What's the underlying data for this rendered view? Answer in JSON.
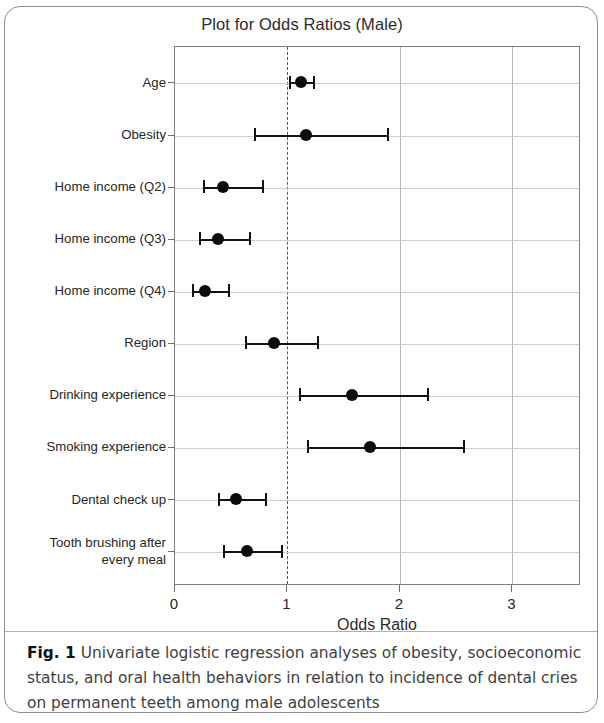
{
  "figure": {
    "caption_label": "Fig. 1",
    "caption_text": "Univariate logistic regression analyses of obesity, socioeconomic status, and oral health behaviors in relation to incidence of dental cries on permanent teeth among male adolescents"
  },
  "chart_data": {
    "type": "forest",
    "title": "Plot for Odds Ratios (Male)",
    "xlabel": "Odds Ratio",
    "ylabel": "",
    "xlim": [
      0,
      3.61
    ],
    "xticks": [
      0,
      1,
      2,
      3
    ],
    "xtick_labels": [
      "0",
      "1",
      "2",
      "3"
    ],
    "reference_line": 1,
    "grid": "both",
    "legend": "none",
    "categories": [
      "Age",
      "Obesity",
      "Home income (Q2)",
      "Home income (Q3)",
      "Home income (Q4)",
      "Region",
      "Drinking experience",
      "Smoking experience",
      "Dental check up",
      "Tooth brushing after\nevery meal"
    ],
    "series": [
      {
        "name": "Odds ratio (95% CI)",
        "points": [
          {
            "label": "Age",
            "or": 1.13,
            "ci_low": 1.02,
            "ci_high": 1.24
          },
          {
            "label": "Obesity",
            "or": 1.17,
            "ci_low": 0.71,
            "ci_high": 1.89
          },
          {
            "label": "Home income (Q2)",
            "or": 0.44,
            "ci_low": 0.26,
            "ci_high": 0.78
          },
          {
            "label": "Home income (Q3)",
            "or": 0.39,
            "ci_low": 0.22,
            "ci_high": 0.67
          },
          {
            "label": "Home income (Q4)",
            "or": 0.28,
            "ci_low": 0.16,
            "ci_high": 0.48
          },
          {
            "label": "Region",
            "or": 0.89,
            "ci_low": 0.63,
            "ci_high": 1.27
          },
          {
            "label": "Drinking experience",
            "or": 1.58,
            "ci_low": 1.11,
            "ci_high": 2.25
          },
          {
            "label": "Smoking experience",
            "or": 1.74,
            "ci_low": 1.18,
            "ci_high": 2.57
          },
          {
            "label": "Dental check up",
            "or": 0.55,
            "ci_low": 0.39,
            "ci_high": 0.81
          },
          {
            "label": "Tooth brushing after every meal",
            "or": 0.65,
            "ci_low": 0.44,
            "ci_high": 0.95
          }
        ]
      }
    ]
  }
}
